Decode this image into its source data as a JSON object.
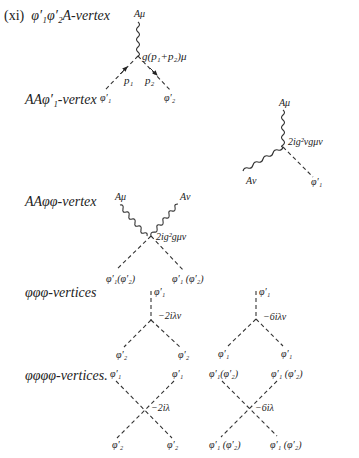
{
  "sections": [
    {
      "id": "xi",
      "prefix": "(xi)",
      "title": "φ′₁φ′₂A-vertex"
    },
    {
      "id": "aaphi1",
      "title": "AAφ′₁-vertex"
    },
    {
      "id": "aaphiphi",
      "title": "AAφφ-vertex"
    },
    {
      "id": "phi3",
      "title": "φφφ-vertices"
    },
    {
      "id": "phi4",
      "title": "φφφφ-vertices."
    }
  ],
  "diagrams": {
    "phi_phi_A": {
      "top_label": "Aμ",
      "coupling": "g(p₁+p₂)μ",
      "momentum_left": "p₁",
      "momentum_right": "p₂",
      "leg_left": "φ′₁",
      "leg_right": "φ′₂"
    },
    "A_A_phi1": {
      "top_label": "Aμ",
      "left_label": "Aν",
      "right_label": "φ′₁",
      "coupling": "2ig²vgμν"
    },
    "A_A_phi_phi": {
      "top_left": "Aμ",
      "top_right": "Aν",
      "bottom_left": "φ′₁(φ′₂)",
      "bottom_right": "φ′₁ (φ′₂)",
      "coupling": "2ig²gμν"
    },
    "phi3_a": {
      "top": "φ′₁",
      "bottom_left": "φ′₂",
      "bottom_right": "φ′₂",
      "coupling": "−2iλv"
    },
    "phi3_b": {
      "top": "φ′₁",
      "bottom_left": "φ′₁",
      "bottom_right": "φ′₁",
      "coupling": "−6iλv"
    },
    "phi4_a": {
      "top_left": "φ′₁",
      "top_right": "φ′₁",
      "bottom_left": "φ′₂",
      "bottom_right": "φ′₂",
      "coupling": "−2iλ"
    },
    "phi4_b": {
      "top_left": "φ′₁(φ′₂)",
      "top_right": "φ′₁ (φ′₂)",
      "bottom_left": "φ′₁ (φ′₂)",
      "bottom_right": "φ′₁ (φ′₂)",
      "coupling": "−6iλ"
    }
  }
}
